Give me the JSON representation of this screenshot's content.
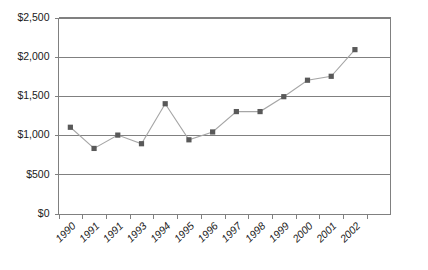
{
  "chart_data": {
    "type": "line",
    "title": "",
    "subtitle": "",
    "xlabel": "",
    "ylabel": "",
    "categories": [
      "1990",
      "1991",
      "1991",
      "1993",
      "1994",
      "1995",
      "1996",
      "1997",
      "1998",
      "1999",
      "2000",
      "2001",
      "2002"
    ],
    "values": [
      1100,
      830,
      1000,
      890,
      1400,
      940,
      1040,
      1300,
      1300,
      1490,
      1700,
      1750,
      2090
    ],
    "series": [
      {
        "name": "",
        "values": [
          1100,
          830,
          1000,
          890,
          1400,
          940,
          1040,
          1300,
          1300,
          1490,
          1700,
          1750,
          2090
        ]
      }
    ],
    "ylim": [
      0,
      2500
    ],
    "ytick_values": [
      0,
      500,
      1000,
      1500,
      2000,
      2500
    ],
    "ytick_labels": [
      "$0",
      "$500",
      "$1,000",
      "$1,500",
      "$2,000",
      "$2,500"
    ],
    "xtick_labels": [
      "1990",
      "1991",
      "1991",
      "1993",
      "1994",
      "1995",
      "1996",
      "1997",
      "1998",
      "1999",
      "2000",
      "2001",
      "2002"
    ],
    "grid": true,
    "grid_axis": "y",
    "legend": false,
    "legend_position": "none",
    "marker": "square",
    "annotations": []
  },
  "style": {
    "line_color": "#a6a6a6",
    "marker_color": "#595959",
    "grid_color": "#808080",
    "axis_color": "#808080",
    "text_color": "#1a1a1a",
    "background": "#ffffff"
  },
  "axis": {
    "y_labels": [
      "$2,500",
      "$2,000",
      "$1,500",
      "$1,000",
      "$500",
      "$0"
    ],
    "x_labels": [
      "1990",
      "1991",
      "1991",
      "1993",
      "1994",
      "1995",
      "1996",
      "1997",
      "1998",
      "1999",
      "2000",
      "2001",
      "2002"
    ]
  }
}
